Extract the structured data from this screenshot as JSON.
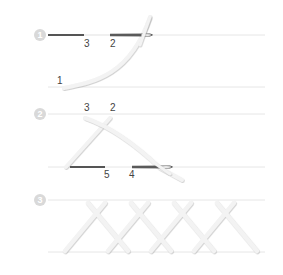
{
  "colors": {
    "guide_line": "#e6e6e6",
    "step_circle": "#d9d9d9",
    "thread_dark": "#555555",
    "thread_light": "#f2f2f2",
    "thread_shadow": "#d6d6d6",
    "label": "#444444",
    "needle": "#5a5a5a"
  },
  "steps": [
    {
      "number": "1",
      "labels": [
        {
          "text": "3",
          "x": 84,
          "y": 47
        },
        {
          "text": "2",
          "x": 110,
          "y": 47
        },
        {
          "text": "1",
          "x": 57,
          "y": 84
        }
      ]
    },
    {
      "number": "2",
      "labels": [
        {
          "text": "3",
          "x": 84,
          "y": 111
        },
        {
          "text": "2",
          "x": 110,
          "y": 111
        },
        {
          "text": "5",
          "x": 104,
          "y": 178
        },
        {
          "text": "4",
          "x": 129,
          "y": 178
        }
      ]
    },
    {
      "number": "3",
      "labels": []
    }
  ]
}
